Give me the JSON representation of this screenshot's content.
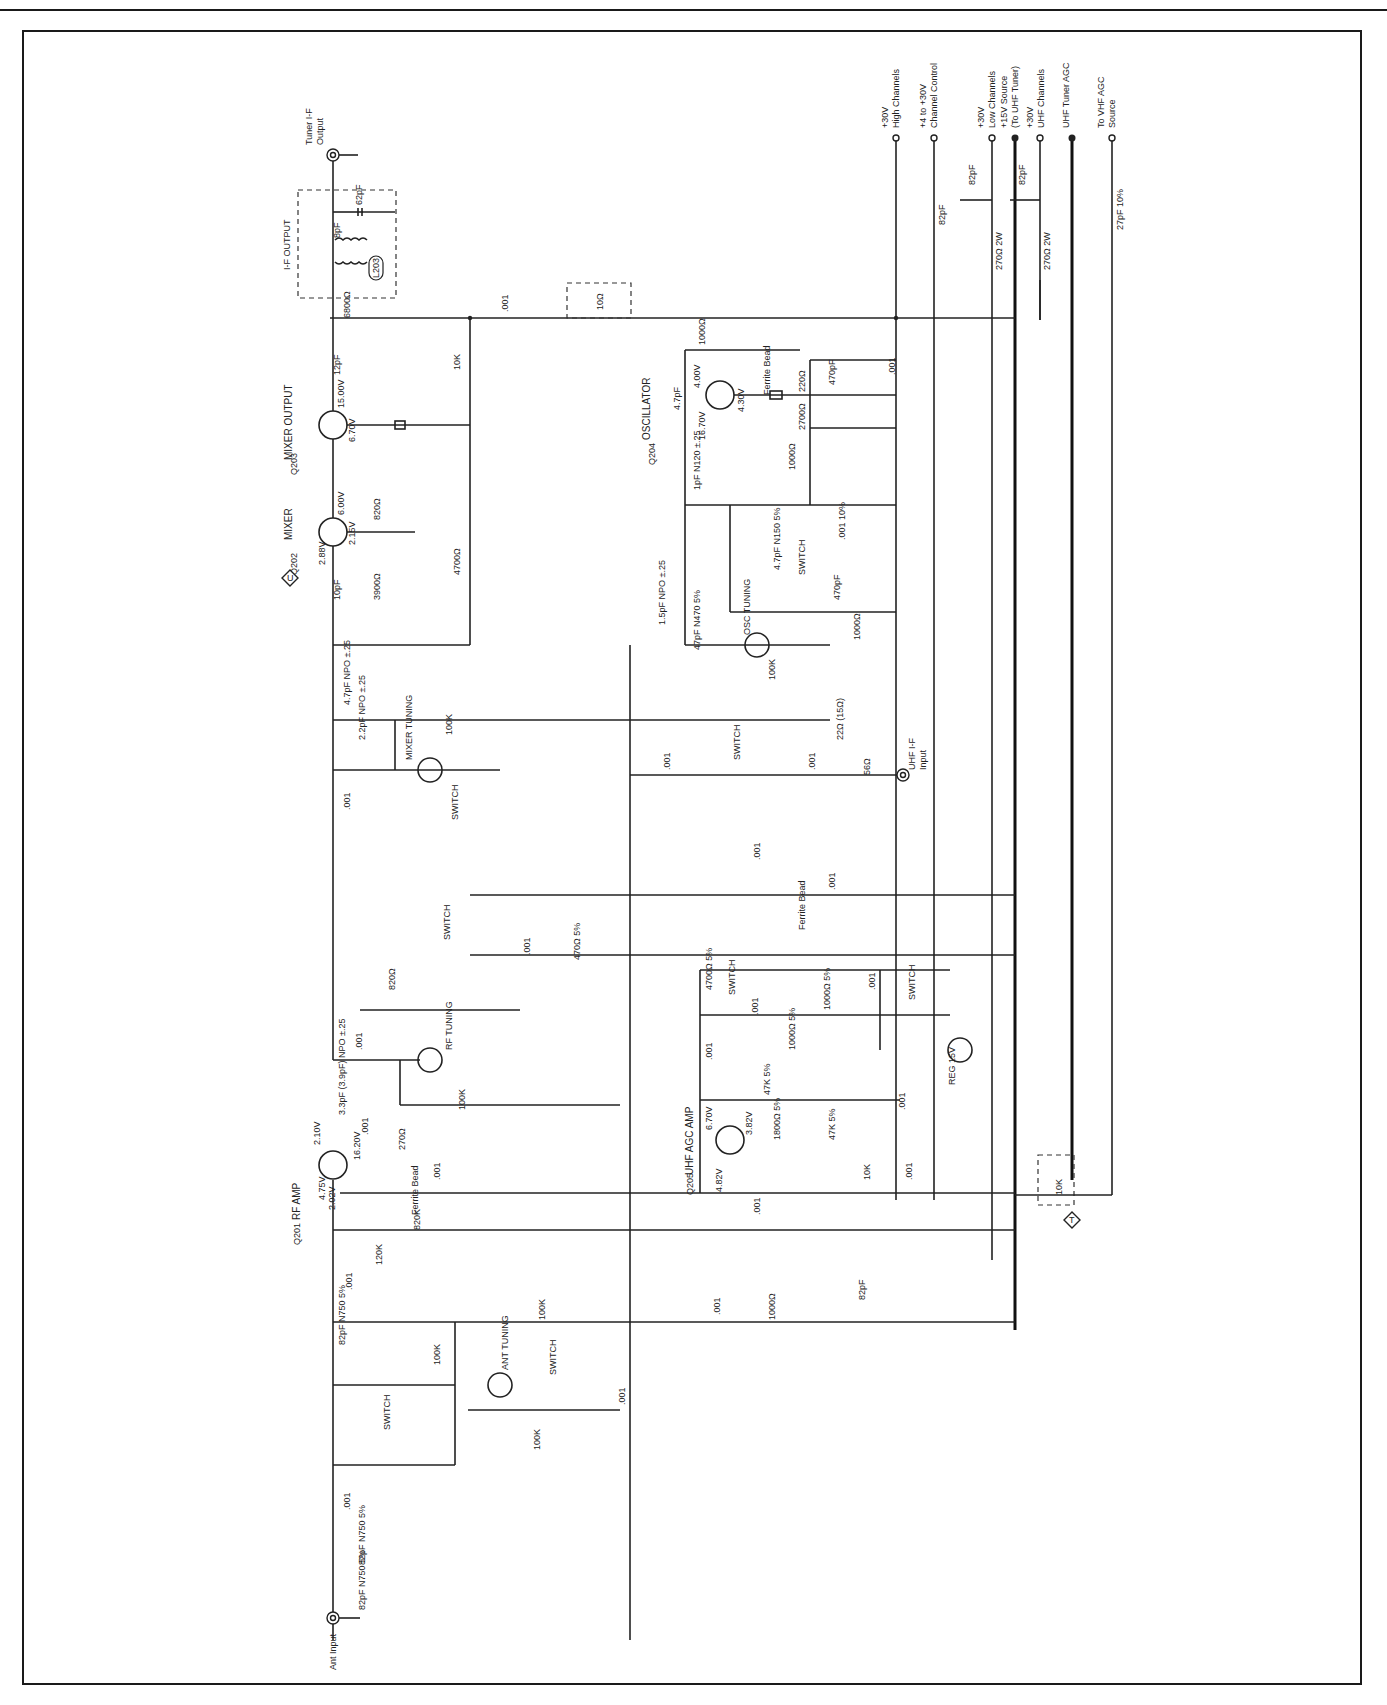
{
  "diagram": {
    "type": "electronic-schematic",
    "orientation": "rotated-90-ccw",
    "colors": {
      "ink": "#222222",
      "paper": "#ffffff"
    }
  },
  "terminals": {
    "tuner_if_output": {
      "line1": "Tuner I-F",
      "line2": "Output"
    },
    "ant_input": "Ant Input",
    "uhf_if_input": {
      "line1": "UHF I-F",
      "line2": "Input"
    },
    "supply": [
      {
        "id": "p30_high",
        "line1": "+30V",
        "line2": "High Channels"
      },
      {
        "id": "channel_control",
        "line1": "+4 to +30V",
        "line2": "Channel Control"
      },
      {
        "id": "p30_low",
        "line1": "+30V",
        "line2": "Low Channels"
      },
      {
        "id": "p15_source",
        "line1": "+15V Source",
        "line2": "(To UHF Tuner)"
      },
      {
        "id": "p30_uhf",
        "line1": "+30V",
        "line2": "UHF Channels"
      },
      {
        "id": "uhf_agc",
        "line1": "UHF Tuner AGC",
        "line2": ""
      },
      {
        "id": "vhf_agc",
        "line1": "To VHF AGC",
        "line2": "Source"
      }
    ],
    "diamond_u": "U",
    "diamond_t": "T"
  },
  "stages": {
    "if_output": "I-F OUTPUT",
    "mixer_output": "MIXER OUTPUT",
    "mixer": "MIXER",
    "oscillator": "OSCILLATOR",
    "rf_amp": "RF AMP",
    "uhf_agc_amp": "UHF AGC AMP",
    "osc_tuning": "OSC TUNING",
    "mixer_tuning": "MIXER TUNING",
    "rf_tuning": "RF TUNING",
    "ant_tuning": "ANT TUNING",
    "reg": "REG 15V",
    "switch": "SWITCH",
    "ferrite_bead": "Ferrite Bead"
  },
  "transistors": [
    {
      "ref": "Q203",
      "name": "MIXER OUTPUT",
      "c": "15.00V",
      "b": "6.70V"
    },
    {
      "ref": "Q202",
      "name": "MIXER",
      "c": "6.00V",
      "e": "2.15V",
      "b": "2.88V"
    },
    {
      "ref": "Q204",
      "name": "OSCILLATOR",
      "e": "4.00V",
      "b": "4.30V",
      "c": "16.70V"
    },
    {
      "ref": "Q201",
      "name": "RF AMP",
      "d": "2.10V",
      "s": "16.20V",
      "g2": "4.75V",
      "g1": "2.02V"
    },
    {
      "ref": "Q205",
      "name": "UHF AGC AMP",
      "c": "6.70V",
      "e": "3.82V",
      "b": "4.82V"
    }
  ],
  "components": {
    "L203": "L203",
    "C219": "12pF",
    "R215": "6800Ω",
    "C271": ".001",
    "R216": "10Ω",
    "R214": "10K",
    "C220": ".001",
    "C218": ".001",
    "R212": "820Ω",
    "R213": "4700Ω",
    "C217": "10pF",
    "R211": "3900Ω",
    "C216": "4.7pF NPO ±.25",
    "C215": "2.2pF NPO ±.25",
    "R210": "100K",
    "X212": "MIXER TUNING",
    "C214": ".001",
    "CR4": "SWITCH",
    "R232": "1000Ω",
    "L706": "L706",
    "C279": "4.7pF",
    "C240": "470pF",
    "R231": "220Ω",
    "R230": "2700Ω",
    "R229": "1000Ω",
    "C241": ".001",
    "C238": "1pF N120 ±.25",
    "L205": "L205",
    "C237": ".001 10%",
    "C236": "4.7pF N150 5%",
    "CR6": "SWITCH",
    "C235": "470pF",
    "R228": "1000Ω",
    "C233": "1.5pF NPO ±.25",
    "C234": "47pF N470 5%",
    "X213": "OSC TUNING",
    "R227": "100K",
    "C230": ".001",
    "CR5": "SWITCH",
    "C232": ".001",
    "R225": "22Ω (15Ω)",
    "R226": "56Ω",
    "L201": "L201",
    "C231": ".001",
    "L204": "L204",
    "C239": ".001",
    "C213": ".001",
    "R209": "470Ω 5%",
    "CR3": "SWITCH",
    "R208": "820Ω",
    "C212": ".001",
    "X211": "RF TUNING",
    "C209": "3.3pF (3.9pF) NPO ±.25",
    "R207": "100K",
    "C210": ".001",
    "R206": "270Ω",
    "C211": ".001",
    "R205": "820K",
    "R204": "120K",
    "C204": ".001",
    "R203": "100K",
    "CR2": "SWITCH",
    "C203": "82pF N750 5%",
    "R201": "100K",
    "X210": "ANT TUNING",
    "C206": ".001",
    "R202": "100K",
    "C205": ".001",
    "CR1": "SWITCH",
    "C202": ".001",
    "C201b": "82pF N750 5%",
    "C201a": "82pF N750 5%",
    "R222": "4700Ω 5%",
    "CR8": "SWITCH",
    "C226": ".001",
    "R224": "1000Ω 5%",
    "C227": ".001",
    "CR7": "SWITCH",
    "C225": ".001",
    "R223": "1000Ω 5%",
    "L202": "L202",
    "X209": "REG 15V",
    "R220": "47K 5%",
    "R219": "1800Ω 5%",
    "R221": "47K 5%",
    "C228": ".001",
    "R218": "10K",
    "C224": ".001",
    "C223": ".001",
    "C207": ".001",
    "R217": "1000Ω",
    "C208": "82pF",
    "C222": "82pF",
    "C242": "82pF",
    "R233": "270Ω 2W",
    "R234": "270Ω 2W",
    "C243": "82pF",
    "C244": "27pF 10%",
    "R235": "10K",
    "C280": "8pF",
    "C281": "62pF"
  }
}
